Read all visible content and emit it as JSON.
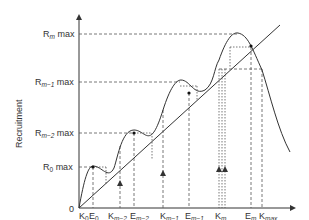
{
  "diagram": {
    "title": "",
    "xlabel": "Spawning Stock",
    "ylabel": "Recruitment",
    "origin_label": "0",
    "colors": {
      "line": "#333333",
      "dashed": "#555555",
      "text": "#333333",
      "background": "#ffffff"
    },
    "y_ticks": [
      {
        "main": "R",
        "sub": "m",
        "suffix": " max"
      },
      {
        "main": "R",
        "sub": "m−1",
        "suffix": " max"
      },
      {
        "main": "R",
        "sub": "m−2",
        "suffix": " max"
      },
      {
        "main": "R",
        "sub": "0",
        "suffix": " max"
      }
    ],
    "x_ticks": [
      {
        "main": "K",
        "sub": "0"
      },
      {
        "main": "E",
        "sub": "0"
      },
      {
        "main": "K",
        "sub": "m−2"
      },
      {
        "main": "E",
        "sub": "m−2"
      },
      {
        "main": "K",
        "sub": "m−1"
      },
      {
        "main": "E",
        "sub": "m−1"
      },
      {
        "main": "K",
        "sub": "m"
      },
      {
        "main": "E",
        "sub": "m"
      },
      {
        "main": "K",
        "sub": "max"
      }
    ],
    "elements": {
      "replacement_line": "1:1 replacement diagonal",
      "recruitment_curve": "multi-humped stock-recruitment curve",
      "equilibrium_points": [
        "E0",
        "Em-2",
        "Em-1",
        "Em"
      ],
      "arrows": [
        "up-arrow at Km-2",
        "up-arrow at Km-1",
        "up-arrows at Km"
      ]
    }
  }
}
